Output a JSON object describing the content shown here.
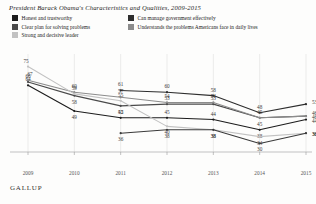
{
  "header": {
    "title": "President Barack Obama's Characteristics and Qualities, 2009-2015"
  },
  "footer": {
    "source": "GALLUP"
  },
  "legend": {
    "items": [
      {
        "label": "Honest and  trustworthy",
        "color": "#1c1c1c"
      },
      {
        "label": "Can manage government effectively",
        "color": "#2e2e2e"
      },
      {
        "label": "Clear plan for solving problems",
        "color": "#4a4a4a"
      },
      {
        "label": "Understands the problems Americans face in daily lives",
        "color": "#8c8c8c"
      },
      {
        "label": "Strong and decisive leader",
        "color": "#c2c2c2"
      }
    ]
  },
  "chart_data": {
    "type": "line",
    "title": "President Barack Obama's Characteristics and Qualities, 2009-2015",
    "xlabel": "",
    "ylabel": "",
    "x": [
      "2009",
      "2010",
      "2011",
      "2012",
      "2013",
      "2014",
      "2015"
    ],
    "xlim": [
      2009,
      2015
    ],
    "ylim": [
      25,
      80
    ],
    "grid": true,
    "legend_position": "top",
    "series": [
      {
        "name": "Honest and  trustworthy",
        "color": "#1c1c1c",
        "x": [
          2009,
          2010,
          2011,
          2012,
          2013,
          2014,
          2015
        ],
        "values": [
          64,
          49,
          45,
          45,
          44,
          38,
          44
        ],
        "labels": [
          "64",
          "49",
          "45",
          "45",
          "44",
          "38",
          "44"
        ]
      },
      {
        "name": "Can manage government effectively",
        "color": "#2e2e2e",
        "x": [
          2011,
          2012,
          2013,
          2014,
          2015
        ],
        "values": [
          61,
          60,
          58,
          48,
          53
        ],
        "labels": [
          "61",
          "60",
          "58",
          "48",
          "53"
        ]
      },
      {
        "name": "Clear plan for solving problems",
        "color": "#4a4a4a",
        "x": [
          2009,
          2010,
          2011,
          2012,
          2013,
          2014,
          2015
        ],
        "values": [
          66,
          58,
          52,
          53,
          53,
          45,
          46
        ],
        "labels": [
          "66",
          "58",
          "52",
          "53",
          "53",
          "45",
          "46"
        ]
      },
      {
        "name": "Understands the problems Americans face in daily lives",
        "color": "#8c8c8c",
        "x": [
          2009,
          2010,
          2011,
          2012,
          2013,
          2014,
          2015
        ],
        "values": [
          67,
          60,
          57,
          54,
          54,
          45,
          46
        ],
        "labels": [
          "67",
          "60",
          "57",
          "54",
          "54",
          "45",
          "46"
        ]
      },
      {
        "name": "Strong and decisive leader",
        "color": "#c2c2c2",
        "x": [
          2009,
          2010,
          2011,
          2012,
          2013,
          2014,
          2015
        ],
        "values": [
          75,
          59,
          55,
          40,
          38,
          34,
          36
        ],
        "labels": [
          "75",
          "59",
          "55",
          "40",
          "38",
          "34",
          "36"
        ]
      },
      {
        "name": "Strong and decisive leader lower",
        "color": "#3a3a3a",
        "x": [
          2011,
          2012,
          2013,
          2014,
          2015
        ],
        "values": [
          36,
          38,
          38,
          30,
          36
        ],
        "labels": [
          "36",
          "38",
          "38",
          "30",
          "36"
        ]
      }
    ],
    "axis_ticks": [
      "2009",
      "2010",
      "2011",
      "2012",
      "2013",
      "2014",
      "2015"
    ]
  }
}
